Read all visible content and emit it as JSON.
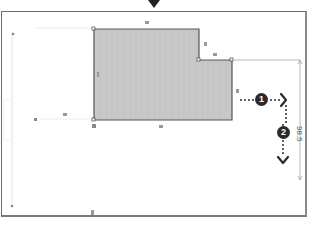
{
  "drawing": {
    "colors": {
      "shape_fill": "#c8c8c8",
      "shape_stroke": "#555555",
      "frame_stroke": "#6e6e6e",
      "badge_fill": "#2b2b2b",
      "dim_line": "#9a9a9a"
    },
    "dimension_label": "98.5",
    "steps": [
      {
        "number": "1"
      },
      {
        "number": "2"
      }
    ],
    "icons": {
      "top_marker": "triangle-down-icon",
      "arrow_right": "chevron-right-icon",
      "arrow_down": "chevron-down-icon"
    }
  }
}
